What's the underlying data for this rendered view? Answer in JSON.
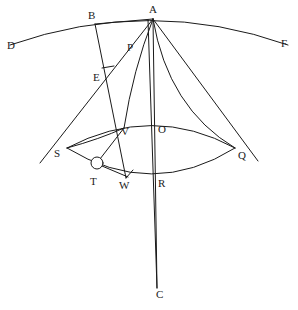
{
  "figure": {
    "type": "geometric-construction-diagram",
    "width": 298,
    "height": 310,
    "background_color": "#ffffff",
    "stroke_color": "#1a1a1a",
    "label_color": "#1a1a1a"
  },
  "points": [
    {
      "id": "D",
      "label": "D",
      "x": 10,
      "y": 45,
      "label_x": 7,
      "label_y": 40
    },
    {
      "id": "B",
      "label": "B",
      "x": 95,
      "y": 23,
      "label_x": 88,
      "label_y": 10
    },
    {
      "id": "A",
      "label": "A",
      "x": 153,
      "y": 18,
      "label_x": 149,
      "label_y": 4
    },
    {
      "id": "F",
      "label": "F",
      "x": 288,
      "y": 45,
      "label_x": 281,
      "label_y": 38
    },
    {
      "id": "P",
      "label": "P",
      "x": 132,
      "y": 44,
      "label_x": 127,
      "label_y": 42
    },
    {
      "id": "E",
      "label": "E",
      "x": 105,
      "y": 75,
      "label_x": 93,
      "label_y": 72
    },
    {
      "id": "V",
      "label": "V",
      "x": 124,
      "y": 128,
      "label_x": 121,
      "label_y": 126
    },
    {
      "id": "O",
      "label": "O",
      "x": 153,
      "y": 128,
      "label_x": 158,
      "label_y": 124
    },
    {
      "id": "S",
      "label": "S",
      "x": 67,
      "y": 148,
      "label_x": 54,
      "label_y": 148
    },
    {
      "id": "Q",
      "label": "Q",
      "x": 235,
      "y": 148,
      "label_x": 238,
      "label_y": 150
    },
    {
      "id": "T",
      "label": "T",
      "x": 97,
      "y": 165,
      "label_x": 90,
      "label_y": 176
    },
    {
      "id": "W",
      "label": "W",
      "x": 126,
      "y": 178,
      "label_x": 119,
      "label_y": 180
    },
    {
      "id": "R",
      "label": "R",
      "x": 153,
      "y": 178,
      "label_x": 158,
      "label_y": 178
    },
    {
      "id": "C",
      "label": "C",
      "x": 157,
      "y": 288,
      "label_x": 156,
      "label_y": 289
    }
  ],
  "marker": {
    "circle_at": "T",
    "circle_cx": 97,
    "circle_cy": 163,
    "circle_r": 6
  },
  "tick": {
    "at": "E",
    "x1": 102,
    "y1": 68,
    "x2": 114,
    "y2": 66
  }
}
